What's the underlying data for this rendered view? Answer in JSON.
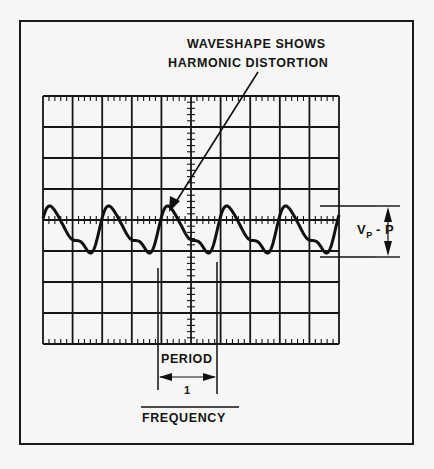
{
  "diagram": {
    "type": "oscilloscope-display",
    "annotation": {
      "line1": "WAVESHAPE SHOWS",
      "line2": "HARMONIC DISTORTION"
    },
    "amplitude_label": {
      "main": "V",
      "sub": "P",
      "suffix": "- P"
    },
    "period_label": "PERIOD",
    "formula": {
      "numerator": "1",
      "denominator": "FREQUENCY"
    },
    "graticule": {
      "columns": 10,
      "rows": 8,
      "minor_ticks_per_division": 5
    },
    "waveform": {
      "cycles_visible": 5.5,
      "description": "fundamental with harmonic distortion (secondary bump after each peak)"
    },
    "colors": {
      "ink": "#141414",
      "paper": "#f6f6f4"
    }
  }
}
